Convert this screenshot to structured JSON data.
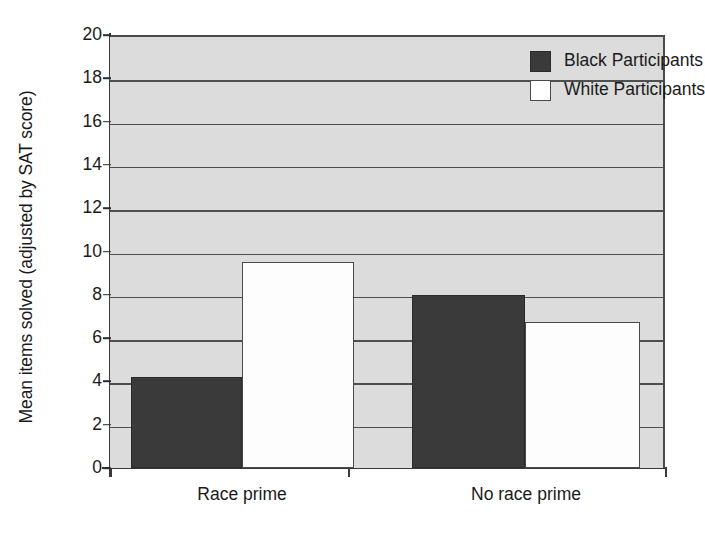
{
  "chart_data": {
    "type": "bar",
    "title": "",
    "xlabel": "",
    "ylabel": "Mean items solved (adjusted by SAT score)",
    "categories": [
      "Race prime",
      "No race prime"
    ],
    "series": [
      {
        "name": "Black Participants",
        "color": "#3a3a3a",
        "values": [
          4.2,
          8.0
        ]
      },
      {
        "name": "White Participants",
        "color": "#ffffff",
        "values": [
          9.5,
          6.75
        ]
      }
    ],
    "ylim": [
      0,
      20
    ],
    "ytick_step": 2,
    "yticks": [
      20,
      18,
      16,
      14,
      12,
      10,
      8,
      6,
      4,
      2,
      0
    ],
    "ytick_labels": [
      "20",
      "18",
      "16",
      "14",
      "12",
      "10",
      "8",
      "6",
      "4",
      "2",
      "0"
    ],
    "grid": true,
    "grid_axis": "y",
    "legend_position": "top-right",
    "plot_background": "#dcdcdc",
    "axis_color": "#3a3a3a",
    "grid_color": "#4f4f4f"
  }
}
